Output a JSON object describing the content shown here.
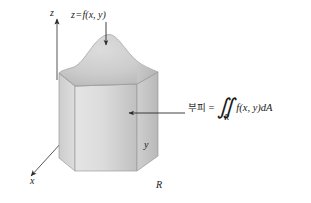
{
  "figure": {
    "background_color": "#ffffff",
    "ink_color": "#1a1a1a"
  },
  "axes": {
    "z_label": "z",
    "y_label": "y",
    "x_label": "x",
    "z_direction": "up",
    "y_direction": "right",
    "x_direction": "lower-left"
  },
  "annotations": {
    "surface": {
      "variable": "z",
      "equals": "=",
      "function": "f(x, y)",
      "full": "z = f(x, y)",
      "arrow": "down-arrow-to-surface"
    },
    "volume": {
      "term": "부피",
      "equals": "=",
      "integral_symbol": "∬",
      "integral_subscript": "R",
      "integrand": "f(x, y)dA",
      "full": "부피 = ∬R f(x, y)dA",
      "arrow": "left-arrow-to-solid"
    },
    "region": {
      "label": "R"
    }
  },
  "colors": {
    "surface_light": "#d6d6d6",
    "surface_mid": "#c4c4c4",
    "surface_dark": "#b0b0b0",
    "prism_front_light": "#e2e2e2",
    "prism_front_dark": "#bdbdbd",
    "prism_side": "#cacaca",
    "outline": "#8f8f8f",
    "axis": "#3a3a3a"
  }
}
